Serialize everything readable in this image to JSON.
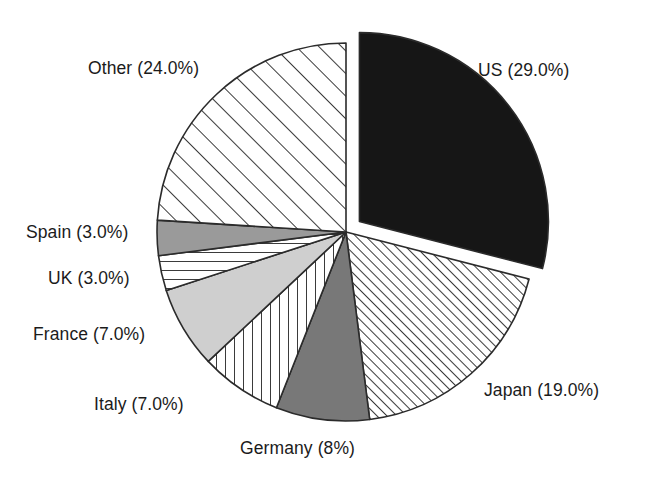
{
  "chart_data": {
    "type": "pie",
    "title": "",
    "subtitle": "",
    "xlabel": "",
    "ylabel": "",
    "legend_position": "none",
    "grid": false,
    "labels_show_percent": true,
    "start_angle_deg": 0,
    "direction": "clockwise",
    "categories": [
      "US",
      "Japan",
      "Germany",
      "Italy",
      "France",
      "UK",
      "Spain",
      "Other"
    ],
    "values": [
      29.0,
      19.0,
      8.0,
      7.0,
      7.0,
      3.0,
      3.0,
      24.0
    ],
    "units": "percent",
    "total": 100.0,
    "slices": [
      {
        "name": "US",
        "value": 29.0,
        "label": "US (29.0%)",
        "fill": "solid-black",
        "color": "#161616",
        "exploded": true,
        "label_x": 478,
        "label_y": 62
      },
      {
        "name": "Japan",
        "value": 19.0,
        "label": "Japan (19.0%)",
        "fill": "diagonal-fine",
        "color": "#4a4a4a",
        "exploded": false,
        "label_x": 484,
        "label_y": 382
      },
      {
        "name": "Germany",
        "value": 8.0,
        "label": "Germany (8%)",
        "fill": "solid-dark-gray",
        "color": "#787878",
        "exploded": false,
        "label_x": 240,
        "label_y": 440
      },
      {
        "name": "Italy",
        "value": 7.0,
        "label": "Italy (7.0%)",
        "fill": "vertical-lines",
        "color": "#4a4a4a",
        "exploded": false,
        "label_x": 94,
        "label_y": 396
      },
      {
        "name": "France",
        "value": 7.0,
        "label": "France (7.0%)",
        "fill": "solid-light-gray",
        "color": "#cfcfcf",
        "exploded": false,
        "label_x": 33,
        "label_y": 326
      },
      {
        "name": "UK",
        "value": 3.0,
        "label": "UK (3.0%)",
        "fill": "horizontal-lines",
        "color": "#4a4a4a",
        "exploded": false,
        "label_x": 48,
        "label_y": 270
      },
      {
        "name": "Spain",
        "value": 3.0,
        "label": "Spain (3.0%)",
        "fill": "solid-mid-gray",
        "color": "#9a9a9a",
        "exploded": false,
        "label_x": 26,
        "label_y": 224
      },
      {
        "name": "Other",
        "value": 24.0,
        "label": "Other (24.0%)",
        "fill": "diagonal-wide",
        "color": "#4a4a4a",
        "exploded": false,
        "label_x": 88,
        "label_y": 60
      }
    ]
  },
  "geometry": {
    "center_x": 346,
    "center_y": 232,
    "radius": 189,
    "explode_offset": 17,
    "background": "#ffffff",
    "outline_color": "#2b2b2b"
  }
}
